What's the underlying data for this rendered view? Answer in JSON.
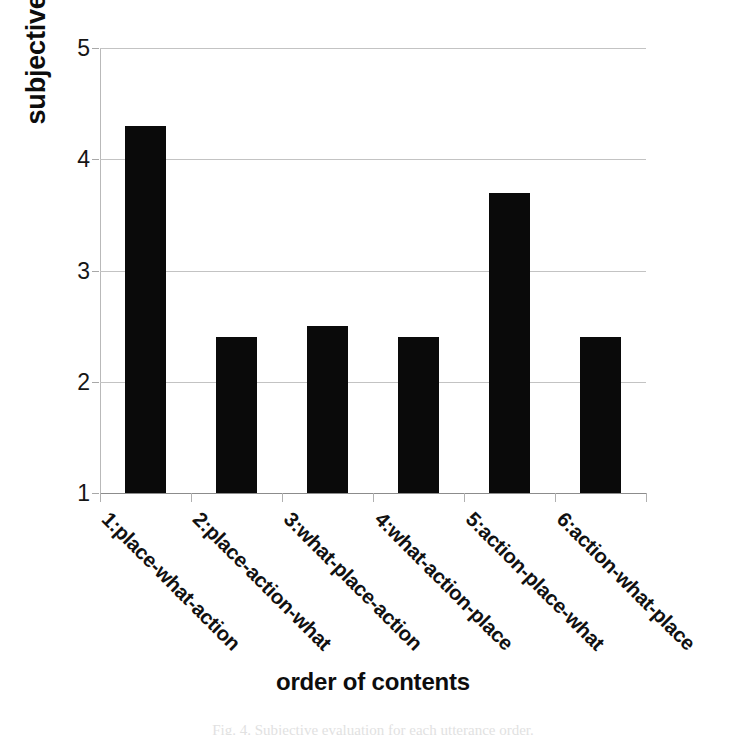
{
  "chart_data": {
    "type": "bar",
    "title": "",
    "xlabel": "order of contents",
    "ylabel": "subjective evaluation",
    "categories": [
      "1:place-what-action",
      "2:place-action-what",
      "3:what-place-action",
      "4:what-action-place",
      "5:action-place-what",
      "6:action-what-place"
    ],
    "values": [
      4.3,
      2.4,
      2.5,
      2.4,
      3.7,
      2.4
    ],
    "ylim": [
      1,
      5
    ],
    "yticks": [
      1,
      2,
      3,
      4,
      5
    ],
    "ytick_labels": [
      "1",
      "2",
      "3",
      "4",
      "5"
    ],
    "grid": true,
    "legend": false,
    "bar_color": "#0a0a0a",
    "gridline_color": "#c3c3c3",
    "axis_color": "#8c8c8c",
    "xtick_label_rotation": 45
  },
  "caption": {
    "text": "Fig. 4. Subjective evaluation for each utterance order."
  }
}
